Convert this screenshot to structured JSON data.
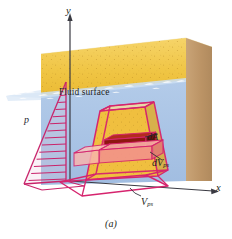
{
  "figure": {
    "caption": "(a)",
    "axes": {
      "x_label": "x",
      "y_label": "y"
    },
    "labels": {
      "fluid_surface": "Fluid surface",
      "pressure": "p",
      "dA": "dA",
      "dV": "dV",
      "dV_subscript": "ps",
      "V": "V",
      "V_subscript": "ps"
    },
    "colors": {
      "sand_front": "#f2c94c",
      "sand_top": "#f7e9b0",
      "sand_side": "#c19a6b",
      "water_front": "#a8c4e5",
      "water_side": "#b99a72",
      "wave_white": "#ffffff",
      "prism_outline": "#d6246e",
      "slab_dark_red": "#9e1b15",
      "slab_light_red": "#f08a82",
      "axis_line": "#3a3a42",
      "text": "#231f20"
    }
  }
}
